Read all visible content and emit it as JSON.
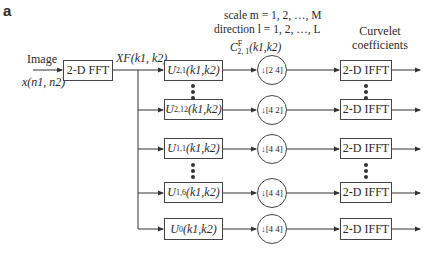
{
  "panel_label": "a",
  "header": {
    "scale_line": "scale m = 1, 2, …, M",
    "direction_line": "direction l = 1, 2, …, L",
    "coef_label": "C",
    "coef_super": "F",
    "coef_sub": "2, 1",
    "coef_args": "(k1,k2)"
  },
  "input": {
    "label": "Image",
    "signal": "x(n1, n2)"
  },
  "fft_block": {
    "label": "2-D FFT"
  },
  "spectrum_label": "XF(k1, k2)",
  "output_label_line1": "Curvelet",
  "output_label_line2": "coefficients",
  "rows": [
    {
      "filter": "U",
      "filter_sub": "2,1",
      "args": "(k1,k2)",
      "decimation": "[2 4]",
      "ifft": "2-D IFFT"
    },
    {
      "filter": "U",
      "filter_sub": "2,12",
      "args": "(k1,k2)",
      "decimation": "[4 2]",
      "ifft": "2-D IFFT"
    },
    {
      "filter": "U",
      "filter_sub": "1,1",
      "args": "(k1,k2)",
      "decimation": "[4 4]",
      "ifft": "2-D IFFT"
    },
    {
      "filter": "U",
      "filter_sub": "1,6",
      "args": "(k1,k2)",
      "decimation": "[4 4]",
      "ifft": "2-D IFFT"
    },
    {
      "filter": "U",
      "filter_sub": "0",
      "args": "(k1,k2)",
      "decimation": "[4 4]",
      "ifft": "2-D IFFT"
    }
  ]
}
